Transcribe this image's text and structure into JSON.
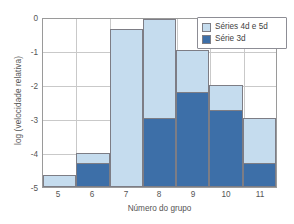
{
  "chart_data": {
    "type": "bar",
    "title": "",
    "subtitle": "",
    "xlabel": "Número do grupo",
    "ylabel": "log (velocidade relativa)",
    "categories": [
      "5",
      "6",
      "7",
      "8",
      "9",
      "10",
      "11"
    ],
    "xlim": [
      4.5,
      11.5
    ],
    "ylim": [
      -5,
      0
    ],
    "y_baseline": -5,
    "yticks": [
      "0",
      "-1",
      "-2",
      "-3",
      "-4",
      "-5"
    ],
    "ytick_values": [
      0,
      -1,
      -2,
      -3,
      -4,
      -5
    ],
    "grid": "horizontal-and-vertical",
    "stacked": false,
    "overlapping_bars": true,
    "legend_position": "top-right",
    "series": [
      {
        "name": "Séries 4d e 5d",
        "color": "#c5dcee",
        "values": [
          -4.63,
          -3.98,
          -0.3,
          0.0,
          -0.92,
          -1.95,
          -2.95
        ]
      },
      {
        "name": "Série 3d",
        "color": "#3d6fa8",
        "values": [
          null,
          -4.28,
          null,
          -2.95,
          -2.18,
          -2.72,
          -4.28
        ]
      }
    ]
  },
  "legend": {
    "items": [
      {
        "label": "Séries 4d e 5d",
        "swatch": "light-blue-swatch"
      },
      {
        "label": "Série 3d",
        "swatch": "dark-blue-swatch"
      }
    ]
  },
  "colors": {
    "light_blue": "#c5dcee",
    "dark_blue": "#3d6fa8",
    "grid": "#c9c9c9",
    "frame": "#9a9a9a",
    "text": "#555555",
    "background": "#ffffff"
  }
}
